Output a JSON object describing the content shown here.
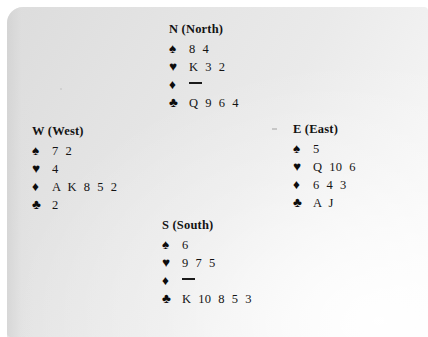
{
  "document": {
    "type": "bridge-hand-diagram",
    "background_color": "#e9e9e9",
    "page_color": "#ffffff",
    "text_color": "#111111"
  },
  "suits": {
    "spade": "♠",
    "heart": "♥",
    "diamond": "♦",
    "club": "♣",
    "void": "—"
  },
  "hands": {
    "north": {
      "compass": "N",
      "name": "(North)",
      "title": "N (North)",
      "spades": "8 4",
      "hearts": "K 3 2",
      "diamonds": "—",
      "clubs": "Q 9 6 4"
    },
    "west": {
      "compass": "W",
      "name": "(West)",
      "title": "W (West)",
      "spades": "7 2",
      "hearts": "4",
      "diamonds": "A K 8 5 2",
      "clubs": "2"
    },
    "east": {
      "compass": "E",
      "name": "(East)",
      "title": "E (East)",
      "spades": "5",
      "hearts": "Q 10 6",
      "diamonds": "6 4 3",
      "clubs": "A J"
    },
    "south": {
      "compass": "S",
      "name": "(South)",
      "title": "S (South)",
      "spades": "6",
      "hearts": "9 7 5",
      "diamonds": "—",
      "clubs": "K 10 8 5 3"
    }
  }
}
